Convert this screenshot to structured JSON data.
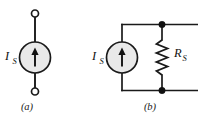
{
  "figure": {
    "type": "electrical-circuit-diagram",
    "background_color": "#ffffff",
    "line_color": "#1a1a1a",
    "source_fill_color": "#e9e9e9",
    "node_color": "#111111",
    "panels": [
      {
        "id": "a",
        "caption": "(a)",
        "title": "Ideal current source",
        "components": [
          {
            "name": "current-source",
            "symbol": "circle-with-up-arrow",
            "label_main": "I",
            "label_sub": "S",
            "label_full": "I_S",
            "direction": "up"
          },
          {
            "name": "terminal-top",
            "symbol": "open-circle"
          },
          {
            "name": "terminal-bottom",
            "symbol": "open-circle"
          }
        ]
      },
      {
        "id": "b",
        "caption": "(b)",
        "title": "Practical current source with parallel resistance",
        "components": [
          {
            "name": "current-source",
            "symbol": "circle-with-up-arrow",
            "label_main": "I",
            "label_sub": "S",
            "label_full": "I_S",
            "direction": "up"
          },
          {
            "name": "resistor",
            "symbol": "zigzag",
            "label_main": "R",
            "label_sub": "S",
            "label_full": "R_S",
            "orientation": "vertical"
          },
          {
            "name": "node-top",
            "symbol": "filled-dot"
          },
          {
            "name": "node-bottom",
            "symbol": "filled-dot"
          }
        ]
      }
    ]
  }
}
